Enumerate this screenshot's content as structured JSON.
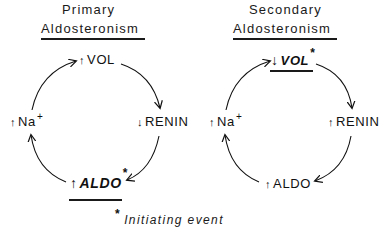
{
  "diagrams": [
    {
      "title_line1": "Primary",
      "title_line2": "Aldosteronism",
      "nodes": {
        "top": {
          "arrow": "↑",
          "label": "VOL",
          "suffix": ""
        },
        "right": {
          "arrow": "↓",
          "label": "RENIN",
          "suffix": ""
        },
        "bottom": {
          "arrow": "↑",
          "label": "ALDO",
          "suffix": "*",
          "emphasized": true
        },
        "left": {
          "arrow": "↑",
          "label": "Na",
          "suffix": "+"
        }
      },
      "cycle": [
        "↑ Na+",
        "↑ VOL",
        "↓ RENIN",
        "↑ ALDO*"
      ],
      "initiating_node": "ALDO"
    },
    {
      "title_line1": "Secondary",
      "title_line2": "Aldosteronism",
      "nodes": {
        "top": {
          "arrow": "↓",
          "label": "VOL",
          "suffix": "*",
          "emphasized": true
        },
        "right": {
          "arrow": "↑",
          "label": "RENIN",
          "suffix": ""
        },
        "bottom": {
          "arrow": "↑",
          "label": "ALDO",
          "suffix": ""
        },
        "left": {
          "arrow": "↑",
          "label": "Na",
          "suffix": "+"
        }
      },
      "cycle": [
        "↑ Na+",
        "↓ VOL*",
        "↑ RENIN",
        "↑ ALDO"
      ],
      "initiating_node": "VOL"
    }
  ],
  "footnote": {
    "marker": "*",
    "text": "Initiating event"
  }
}
